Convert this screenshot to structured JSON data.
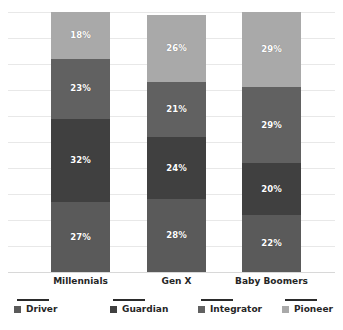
{
  "chart_data": {
    "type": "bar",
    "subtype": "stacked-100-percent",
    "title": "",
    "subtitle": "",
    "xlabel": "",
    "ylabel": "",
    "ylim": [
      0,
      100
    ],
    "grid": true,
    "gridline_interval": 10,
    "legend_position": "bottom",
    "orientation": "vertical",
    "stack_order_bottom_to_top": [
      "Driver",
      "Guardian",
      "Integrator",
      "Pioneer"
    ],
    "categories": [
      "Millennials",
      "Gen X",
      "Baby Boomers"
    ],
    "series": [
      {
        "name": "Driver",
        "color": "#5a5a5a",
        "values": [
          27,
          28,
          22
        ],
        "labels": [
          "27%",
          "28%",
          "22%"
        ]
      },
      {
        "name": "Guardian",
        "color": "#404040",
        "values": [
          32,
          24,
          20
        ],
        "labels": [
          "32%",
          "24%",
          "20%"
        ]
      },
      {
        "name": "Integrator",
        "color": "#616161",
        "values": [
          23,
          21,
          29
        ],
        "labels": [
          "23%",
          "21%",
          "29%"
        ]
      },
      {
        "name": "Pioneer",
        "color": "#a9a9a9",
        "values": [
          18,
          26,
          29
        ],
        "labels": [
          "18%",
          "26%",
          "29%"
        ]
      }
    ],
    "column_totals": [
      100,
      100,
      100
    ],
    "gridline_values": [
      100,
      90,
      80,
      70,
      60,
      50,
      40,
      30,
      20,
      10,
      0
    ],
    "colors": {
      "background": "#ffffff",
      "gridline": "#e8e8e8",
      "baseline": "#d8d8d8",
      "label_text": "#ffffff",
      "axis_text": "#262626",
      "legend_rule": "#2b2b2b"
    }
  },
  "axis": {
    "categories": [
      {
        "label": "Millennials"
      },
      {
        "label": "Gen X"
      },
      {
        "label": "Baby Boomers"
      }
    ]
  },
  "legend": {
    "items": [
      {
        "label": "Driver",
        "swatch_color": "#5a5a5a"
      },
      {
        "label": "Guardian",
        "swatch_color": "#404040"
      },
      {
        "label": "Integrator",
        "swatch_color": "#616161"
      },
      {
        "label": "Pioneer",
        "swatch_color": "#a9a9a9"
      }
    ]
  },
  "bars": [
    {
      "category": "Millennials",
      "segments": [
        {
          "name": "Pioneer",
          "label": "18%",
          "value": 18,
          "color": "#a9a9a9"
        },
        {
          "name": "Integrator",
          "label": "23%",
          "value": 23,
          "color": "#616161"
        },
        {
          "name": "Guardian",
          "label": "32%",
          "value": 32,
          "color": "#404040"
        },
        {
          "name": "Driver",
          "label": "27%",
          "value": 27,
          "color": "#5a5a5a"
        }
      ]
    },
    {
      "category": "Gen X",
      "segments": [
        {
          "name": "Pioneer",
          "label": "26%",
          "value": 26,
          "color": "#a9a9a9"
        },
        {
          "name": "Integrator",
          "label": "21%",
          "value": 21,
          "color": "#616161"
        },
        {
          "name": "Guardian",
          "label": "24%",
          "value": 24,
          "color": "#404040"
        },
        {
          "name": "Driver",
          "label": "28%",
          "value": 28,
          "color": "#5a5a5a"
        }
      ]
    },
    {
      "category": "Baby Boomers",
      "segments": [
        {
          "name": "Pioneer",
          "label": "29%",
          "value": 29,
          "color": "#a9a9a9"
        },
        {
          "name": "Integrator",
          "label": "29%",
          "value": 29,
          "color": "#616161"
        },
        {
          "name": "Guardian",
          "label": "20%",
          "value": 20,
          "color": "#404040"
        },
        {
          "name": "Driver",
          "label": "22%",
          "value": 22,
          "color": "#5a5a5a"
        }
      ]
    }
  ],
  "layout": {
    "bar_left_positions": [
      43,
      139,
      234
    ],
    "bar_width": 59,
    "category_label_centers": [
      72.5,
      168.5,
      263.5
    ],
    "legend_item_lefts": [
      14,
      110,
      198,
      282
    ]
  }
}
